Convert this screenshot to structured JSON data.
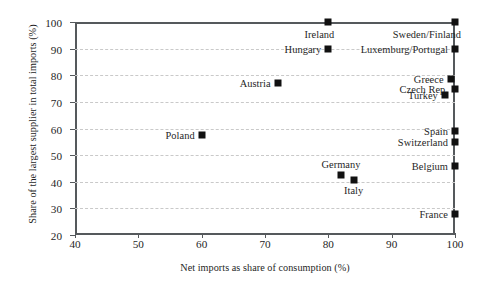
{
  "chart_data": {
    "type": "scatter",
    "title": "",
    "xlabel": "Net imports as share of consumption (%)",
    "ylabel": "Share of the largest supplier in total imports (%)",
    "xlim": [
      40,
      100
    ],
    "ylim": [
      20,
      100
    ],
    "xticks": [
      40,
      50,
      60,
      70,
      80,
      90,
      100
    ],
    "yticks": [
      20,
      30,
      40,
      50,
      60,
      70,
      80,
      90,
      100
    ],
    "grid": "horizontal-dashed",
    "legend": "none",
    "marker": "filled-square",
    "marker_color": "#111111",
    "grid_color": "#c9c9c9",
    "axis_color": "#55595c",
    "points": [
      {
        "label": "Sweden/Finland",
        "x": 100.0,
        "y": 100.0,
        "label_pos": "left-below"
      },
      {
        "label": "Ireland",
        "x": 80.0,
        "y": 100.0,
        "label_pos": "left-below"
      },
      {
        "label": "Luxemburg/Portugal",
        "x": 100.0,
        "y": 90.0,
        "label_pos": "left"
      },
      {
        "label": "Hungary",
        "x": 80.0,
        "y": 90.0,
        "label_pos": "left"
      },
      {
        "label": "Greece",
        "x": 99.3,
        "y": 78.5,
        "label_pos": "left"
      },
      {
        "label": "Czech Rep.",
        "x": 100.0,
        "y": 75.0,
        "label_pos": "left"
      },
      {
        "label": "Turkey",
        "x": 98.4,
        "y": 72.5,
        "label_pos": "left"
      },
      {
        "label": "Austria",
        "x": 72.0,
        "y": 77.0,
        "label_pos": "left"
      },
      {
        "label": "Poland",
        "x": 60.0,
        "y": 57.5,
        "label_pos": "left"
      },
      {
        "label": "Spain",
        "x": 100.0,
        "y": 59.0,
        "label_pos": "left"
      },
      {
        "label": "Switzerland",
        "x": 100.0,
        "y": 55.0,
        "label_pos": "left"
      },
      {
        "label": "Belgium",
        "x": 100.0,
        "y": 46.0,
        "label_pos": "left"
      },
      {
        "label": "Germany",
        "x": 82.0,
        "y": 42.5,
        "label_pos": "above"
      },
      {
        "label": "Italy",
        "x": 84.0,
        "y": 40.5,
        "label_pos": "below"
      },
      {
        "label": "France",
        "x": 100.0,
        "y": 28.0,
        "label_pos": "left"
      }
    ]
  }
}
